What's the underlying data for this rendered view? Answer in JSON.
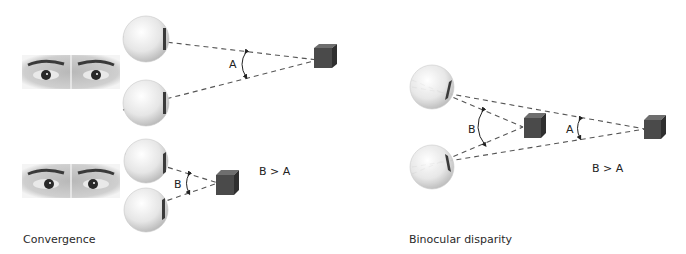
{
  "panels": {
    "convergence": {
      "caption": "Convergence",
      "far": {
        "angle_label": "A"
      },
      "near": {
        "angle_label": "B"
      },
      "comparison": "B > A"
    },
    "binocular_disparity": {
      "caption": "Binocular disparity",
      "near_angle_label": "B",
      "far_angle_label": "A",
      "comparison": "B > A"
    }
  },
  "colors": {
    "background": "#ffffff",
    "dashed_line": "#555555",
    "cube_front": "#4a4a4a",
    "cube_top": "#6e6e6e",
    "cube_side": "#2f2f2f",
    "eyeball": "#e8e8e8",
    "text": "#222222"
  }
}
